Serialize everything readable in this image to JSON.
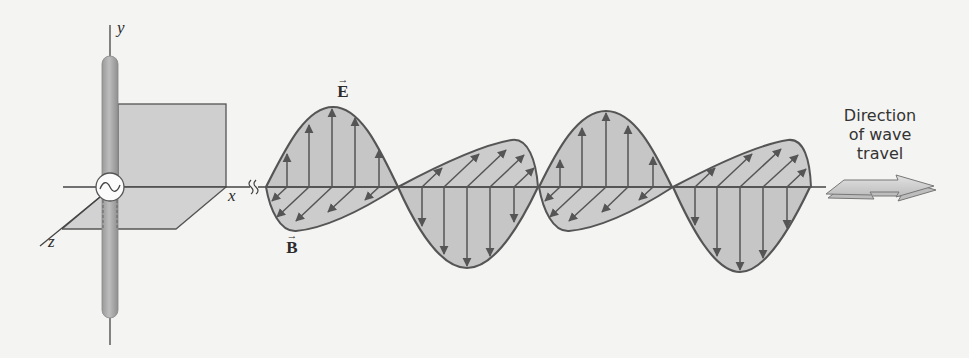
{
  "figure": {
    "axes": {
      "x_label": "x",
      "y_label": "y",
      "z_label": "z"
    },
    "vectors": {
      "electric": {
        "symbol": "E",
        "over": "⃗",
        "arrow": "→"
      },
      "magnetic": {
        "symbol": "B",
        "arrow": "→"
      }
    },
    "direction": {
      "lines": [
        "Direction",
        "of wave",
        "travel"
      ]
    },
    "icons": {
      "ac_source": "∼"
    },
    "colors": {
      "background": "#f4f4f2",
      "fill": "#c9c9c9",
      "plane_fill": "#cfcfcf",
      "stroke": "#555555",
      "rod": "#a8a8a8"
    }
  }
}
